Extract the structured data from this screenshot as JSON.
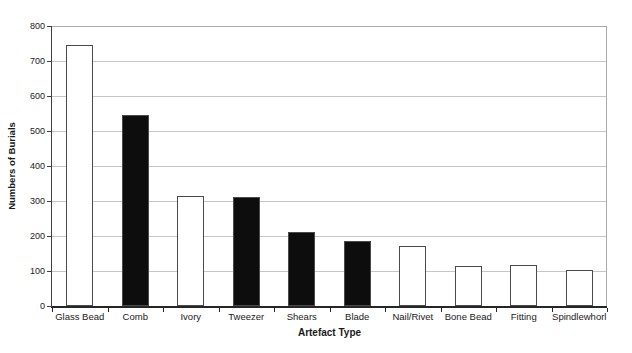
{
  "chart_data": {
    "type": "bar",
    "title": "",
    "categories": [
      "Glass Bead",
      "Comb",
      "Ivory",
      "Tweezer",
      "Shears",
      "Blade",
      "Nail/Rivet",
      "Bone Bead",
      "Fitting",
      "Spindlewhorl"
    ],
    "values": [
      745,
      545,
      315,
      310,
      210,
      185,
      170,
      115,
      118,
      102
    ],
    "bar_fills": [
      "white",
      "black",
      "white",
      "black",
      "black",
      "black",
      "white",
      "white",
      "white",
      "white"
    ],
    "xlabel": "Artefact Type",
    "ylabel": "Numbers of Burials",
    "ylim": [
      0,
      800
    ],
    "yticks": [
      0,
      100,
      200,
      300,
      400,
      500,
      600,
      700,
      800
    ],
    "grid": true,
    "legend_position": "none"
  },
  "colors": {
    "background": "#ffffff",
    "bar_black_fill": "#0d0d0d",
    "bar_white_fill": "#ffffff",
    "bar_outline": "#4a4a4a",
    "gridline": "#c6c6c6",
    "plot_border": "#aaaaaa",
    "axis_line": "#3f3f3f",
    "bottom_axis": "#262626",
    "text": "#1a1a1a"
  }
}
